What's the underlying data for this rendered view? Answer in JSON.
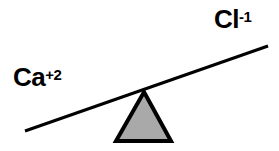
{
  "diagram": {
    "type": "balance-seesaw",
    "background_color": "#ffffff",
    "stroke_color": "#000000",
    "fulcrum_fill_color": "#a9a9a9",
    "labels": {
      "left": {
        "name": "calcium-ion",
        "base": "Ca",
        "charge": "+2",
        "full": "Ca+2"
      },
      "right": {
        "name": "chloride-ion",
        "base": "Cl",
        "charge": "-1",
        "full": "Cl-1"
      }
    },
    "lever": {
      "name": "balance-beam",
      "left_end": {
        "x": 25,
        "y": 131
      },
      "right_end": {
        "x": 268,
        "y": 46
      },
      "stroke_width": 3,
      "tilt": "left-side-down"
    },
    "fulcrum": {
      "name": "triangle-fulcrum",
      "apex": {
        "x": 144,
        "y": 92
      },
      "base_left": {
        "x": 116,
        "y": 141
      },
      "base_right": {
        "x": 171,
        "y": 141
      },
      "stroke_width": 4
    }
  }
}
